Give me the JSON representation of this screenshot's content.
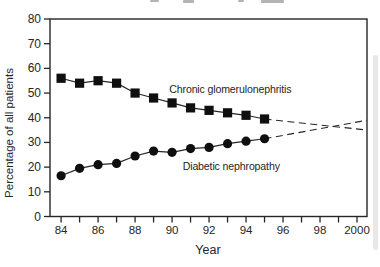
{
  "colors": {
    "ink": "#262626",
    "marker": "#0f0f0f",
    "background": "#ffffff"
  },
  "chart_data": {
    "type": "line",
    "title": "",
    "xlabel": "Year",
    "ylabel": "Percentage of all patients",
    "xlim": [
      1983.4,
      2000.54
    ],
    "ylim": [
      0,
      80
    ],
    "grid": false,
    "legend_position": "inline-labels",
    "y_ticks": [
      0,
      10,
      20,
      30,
      40,
      50,
      60,
      70,
      80
    ],
    "x_tick_years": [
      1984,
      1985,
      1986,
      1987,
      1988,
      1989,
      1990,
      1991,
      1992,
      1993,
      1994,
      1995,
      1996,
      1997,
      1998,
      1999,
      2000
    ],
    "x_major_tick_labels": [
      {
        "year": 1984,
        "label": "84"
      },
      {
        "year": 1986,
        "label": "86"
      },
      {
        "year": 1988,
        "label": "88"
      },
      {
        "year": 1990,
        "label": "90"
      },
      {
        "year": 1992,
        "label": "92"
      },
      {
        "year": 1994,
        "label": "94"
      },
      {
        "year": 1996,
        "label": "96"
      },
      {
        "year": 1998,
        "label": "98"
      },
      {
        "year": 2000,
        "label": "2000"
      }
    ],
    "series": [
      {
        "name": "Chronic glomerulonephritis",
        "marker": "square",
        "line_style": "solid",
        "x": [
          1984,
          1985,
          1986,
          1987,
          1988,
          1989,
          1990,
          1991,
          1992,
          1993,
          1994,
          1995
        ],
        "values": [
          56,
          54,
          55,
          54,
          50,
          48,
          46,
          44,
          43,
          42,
          41,
          39.5
        ],
        "trend_extrapolation": {
          "line_style": "dashed",
          "x": [
            1995,
            2000.54
          ],
          "values": [
            39.5,
            35
          ]
        },
        "label": {
          "text": "Chronic glomerulonephritis",
          "x": 1993.15,
          "y": 51.6
        }
      },
      {
        "name": "Diabetic nephropathy",
        "marker": "circle",
        "line_style": "solid",
        "x": [
          1984,
          1985,
          1986,
          1987,
          1988,
          1989,
          1990,
          1991,
          1992,
          1993,
          1994,
          1995
        ],
        "values": [
          16.5,
          19.5,
          21,
          21.5,
          24.5,
          26.5,
          26,
          27.5,
          28,
          29.5,
          30.5,
          31.5
        ],
        "trend_extrapolation": {
          "line_style": "dashed",
          "x": [
            1995,
            2000.54
          ],
          "values": [
            31.5,
            39
          ]
        },
        "label": {
          "text": "Diabetic nephropathy",
          "x": 1993.2,
          "y": 20.5
        }
      }
    ]
  }
}
